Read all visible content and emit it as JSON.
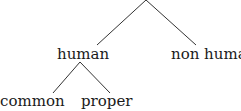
{
  "tree": {
    "root": {
      "label": ""
    },
    "children": [
      {
        "label": "human",
        "children": [
          {
            "label": "common"
          },
          {
            "label": "proper"
          }
        ]
      },
      {
        "label": "non human"
      }
    ]
  },
  "colors": {
    "line": "#333333",
    "text": "#1a1a1a",
    "background": "#ffffff"
  }
}
